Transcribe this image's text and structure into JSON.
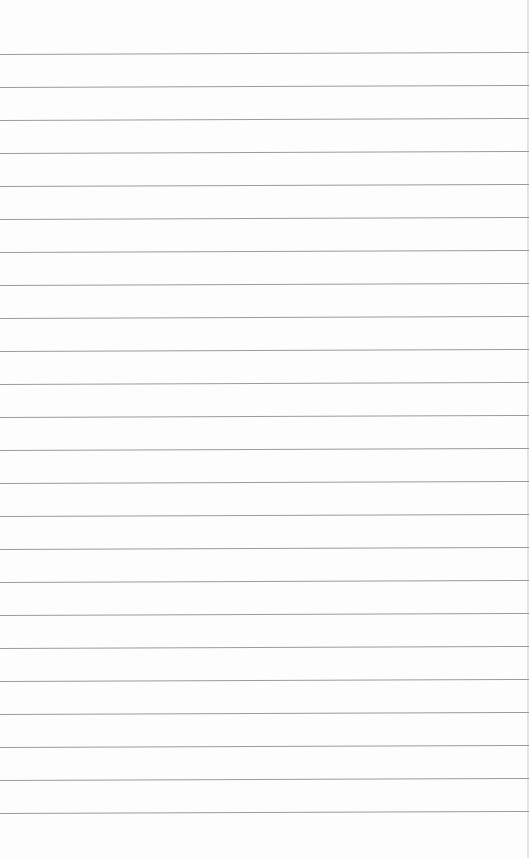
{
  "paper": {
    "type": "lined-paper",
    "background_color": "#fdfdfd",
    "line_color": "#8a8a8a",
    "first_line_y": 54,
    "line_spacing": 33,
    "line_count": 24,
    "text_content": ""
  }
}
